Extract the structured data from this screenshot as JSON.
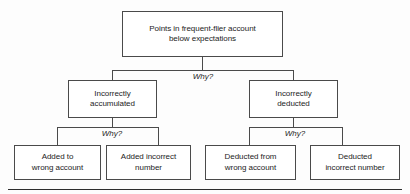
{
  "diagram": {
    "type": "why-why-root-cause-tree",
    "levels": 3,
    "root": {
      "label": "Points in frequent-flier account below expectations",
      "line1": "Points in frequent-flier account",
      "line2": "below expectations"
    },
    "connector_labels": {
      "level1": "Why?",
      "level2_left": "Why?",
      "level2_right": "Why?"
    },
    "level2": [
      {
        "label": "Incorrectly accumulated",
        "line1": "Incorrectly",
        "line2": "accumulated"
      },
      {
        "label": "Incorrectly deducted",
        "line1": "Incorrectly",
        "line2": "deducted"
      }
    ],
    "level3": [
      {
        "label": "Added to wrong account",
        "line1": "Added to",
        "line2": "wrong account"
      },
      {
        "label": "Added incorrect number",
        "line1": "Added incorrect",
        "line2": "number"
      },
      {
        "label": "Deducted from wrong account",
        "line1": "Deducted from",
        "line2": "wrong account"
      },
      {
        "label": "Deducted incorrect number",
        "line1": "Deducted",
        "line2": "incorrect number"
      }
    ],
    "colors": {
      "box_border": "#4a4a4a",
      "box_fill": "#ffffff",
      "text": "#1c1c1c",
      "connector": "#4a4a4a",
      "rule": "#2e2e2e",
      "background": "#fdfdfd"
    }
  }
}
